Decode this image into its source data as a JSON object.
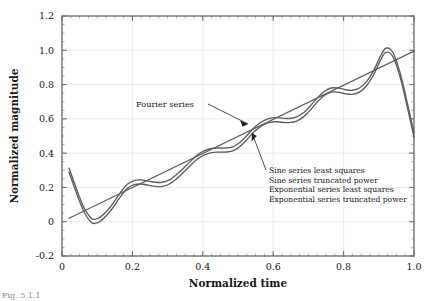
{
  "figure": {
    "caption": "Fig. 5.1.1",
    "background": "#ffffff",
    "curve_color": "#5d5d63",
    "frame_color": "#6f6f6f",
    "grid_color": "#e2e2e6"
  },
  "chart_data": {
    "type": "line",
    "title": "",
    "xlabel": "Normalized time",
    "ylabel": "Normalized magnitude",
    "xlim": [
      0.0,
      1.0
    ],
    "ylim": [
      -0.2,
      1.2
    ],
    "xticks": [
      0.0,
      0.2,
      0.4,
      0.6,
      0.8,
      1.0
    ],
    "xtick_labels": [
      "0",
      "0.2",
      "0.4",
      "0.6",
      "0.8",
      "1.0"
    ],
    "yticks": [
      -0.2,
      0.0,
      0.2,
      0.4,
      0.6,
      0.8,
      1.0,
      1.2
    ],
    "ytick_labels": [
      "-0.2",
      "0",
      "0.2",
      "0.4",
      "0.6",
      "0.8",
      "1.0",
      "1.2"
    ],
    "grid": true,
    "legend_position": "inside-right-annotation",
    "minor_ticks_x": 0.025,
    "minor_ticks_y": 0.05,
    "series": [
      {
        "name": "Fourier series",
        "style": "oscillating",
        "x": [
          0.02,
          0.035,
          0.05,
          0.065,
          0.085,
          0.105,
          0.125,
          0.145,
          0.165,
          0.185,
          0.205,
          0.225,
          0.245,
          0.265,
          0.285,
          0.305,
          0.325,
          0.345,
          0.365,
          0.385,
          0.405,
          0.425,
          0.445,
          0.465,
          0.485,
          0.505,
          0.525,
          0.545,
          0.565,
          0.585,
          0.605,
          0.625,
          0.645,
          0.665,
          0.685,
          0.705,
          0.725,
          0.745,
          0.765,
          0.785,
          0.805,
          0.825,
          0.845,
          0.865,
          0.885,
          0.905,
          0.92,
          0.94,
          0.96,
          0.98,
          1.0
        ],
        "y": [
          0.3,
          0.215,
          0.13,
          0.06,
          0.005,
          0.01,
          0.045,
          0.095,
          0.155,
          0.205,
          0.228,
          0.232,
          0.225,
          0.218,
          0.218,
          0.232,
          0.262,
          0.3,
          0.34,
          0.378,
          0.402,
          0.415,
          0.418,
          0.418,
          0.425,
          0.45,
          0.49,
          0.535,
          0.568,
          0.588,
          0.595,
          0.592,
          0.59,
          0.598,
          0.622,
          0.662,
          0.71,
          0.748,
          0.768,
          0.768,
          0.758,
          0.755,
          0.768,
          0.805,
          0.868,
          0.955,
          1.0,
          0.975,
          0.86,
          0.69,
          0.505
        ]
      },
      {
        "name": "Sine series least squares",
        "style": "near-linear",
        "x": [
          0.02,
          1.0
        ],
        "y": [
          0.02,
          0.995
        ]
      },
      {
        "name": "Sine series truncated power",
        "style": "oscillating-offset",
        "x": [
          0.02,
          0.035,
          0.05,
          0.065,
          0.085,
          0.105,
          0.125,
          0.145,
          0.165,
          0.185,
          0.205,
          0.225,
          0.245,
          0.265,
          0.285,
          0.305,
          0.325,
          0.345,
          0.365,
          0.385,
          0.405,
          0.425,
          0.445,
          0.465,
          0.485,
          0.505,
          0.525,
          0.545,
          0.565,
          0.585,
          0.605,
          0.625,
          0.645,
          0.665,
          0.685,
          0.705,
          0.725,
          0.745,
          0.765,
          0.785,
          0.805,
          0.825,
          0.845,
          0.865,
          0.885,
          0.905,
          0.92,
          0.94,
          0.96,
          0.98,
          1.0
        ],
        "y": [
          0.3,
          0.215,
          0.13,
          0.06,
          0.005,
          0.01,
          0.045,
          0.095,
          0.155,
          0.205,
          0.228,
          0.232,
          0.225,
          0.218,
          0.218,
          0.232,
          0.262,
          0.3,
          0.34,
          0.378,
          0.402,
          0.415,
          0.418,
          0.418,
          0.425,
          0.45,
          0.49,
          0.535,
          0.568,
          0.588,
          0.595,
          0.592,
          0.59,
          0.598,
          0.622,
          0.662,
          0.71,
          0.748,
          0.768,
          0.768,
          0.758,
          0.755,
          0.768,
          0.805,
          0.868,
          0.955,
          1.0,
          0.975,
          0.86,
          0.69,
          0.505
        ]
      },
      {
        "name": "Exponential series least squares",
        "style": "near-linear",
        "x": [
          0.02,
          1.0
        ],
        "y": [
          0.02,
          0.995
        ]
      },
      {
        "name": "Exponential series truncated power",
        "style": "oscillating",
        "x": [
          0.02,
          1.0
        ],
        "y": [
          0.3,
          0.505
        ]
      }
    ],
    "annotations": [
      {
        "id": "fourier-series",
        "text": "Fourier series",
        "text_x": 0.205,
        "text_y": 0.745,
        "target_x": 0.535,
        "target_y": 0.57
      },
      {
        "id": "series-legend",
        "target_x": 0.56,
        "target_y": 0.52
      }
    ],
    "legend_entries": [
      "Sine series least squares",
      "Sine series truncated power",
      "Exponential series least squares",
      "Exponential series truncated power"
    ]
  }
}
